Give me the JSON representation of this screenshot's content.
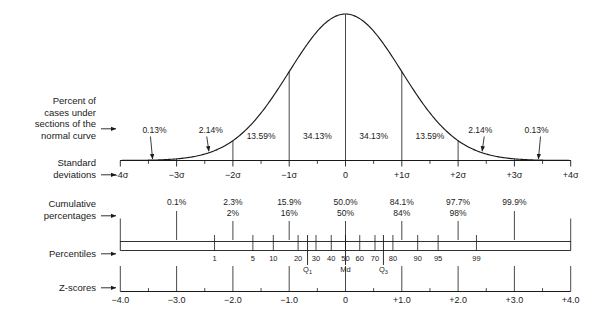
{
  "figure": {
    "background": "#ffffff",
    "ink": "#1a1a1a"
  },
  "row_labels": [
    {
      "id": "percent-of-cases",
      "lines": [
        "Percent of",
        "cases under",
        "sections of the",
        "normal curve"
      ]
    },
    {
      "id": "standard-deviations",
      "lines": [
        "Standard",
        "deviations"
      ]
    },
    {
      "id": "cumulative-percentages",
      "lines": [
        "Cumulative",
        "percentages"
      ]
    },
    {
      "id": "percentiles",
      "lines": [
        "Percentiles"
      ]
    },
    {
      "id": "z-scores",
      "lines": [
        "Z-scores"
      ]
    }
  ],
  "chart_data": {
    "type": "line",
    "xlabel": "Standard deviations",
    "ylabel": "",
    "xlim": [
      -4,
      4
    ],
    "grid": false,
    "legend": null,
    "curve": {
      "name": "normal curve",
      "distribution": "standard normal",
      "mean": 0,
      "sd": 1
    },
    "section_percents": {
      "name": "Percent of cases under sections of the normal curve",
      "bins": [
        {
          "from": -4.0,
          "to": -3.0,
          "label": "0.13%"
        },
        {
          "from": -3.0,
          "to": -2.0,
          "label": "2.14%"
        },
        {
          "from": -2.0,
          "to": -1.0,
          "label": "13.59%"
        },
        {
          "from": -1.0,
          "to": 0.0,
          "label": "34.13%"
        },
        {
          "from": 0.0,
          "to": 1.0,
          "label": "34.13%"
        },
        {
          "from": 1.0,
          "to": 2.0,
          "label": "13.59%"
        },
        {
          "from": 2.0,
          "to": 3.0,
          "label": "2.14%"
        },
        {
          "from": 3.0,
          "to": 4.0,
          "label": "0.13%"
        }
      ],
      "arrow_bins": [
        "0.13%",
        "2.14%"
      ]
    },
    "sd_axis": {
      "name": "Standard deviations",
      "ticks": [
        {
          "value": -4,
          "label": "−4σ"
        },
        {
          "value": -3,
          "label": "−3σ"
        },
        {
          "value": -2,
          "label": "−2σ"
        },
        {
          "value": -1,
          "label": "−1σ"
        },
        {
          "value": 0,
          "label": "0"
        },
        {
          "value": 1,
          "label": "+1σ"
        },
        {
          "value": 2,
          "label": "+2σ"
        },
        {
          "value": 3,
          "label": "+3σ"
        },
        {
          "value": 4,
          "label": "+4σ"
        }
      ],
      "minor_ticks": [
        -3.5,
        -2.5,
        -1.5,
        -0.5,
        0.5,
        1.5,
        2.5,
        3.5
      ]
    },
    "cumulative_percentages": {
      "name": "Cumulative percentages",
      "points": [
        {
          "z": -3,
          "exact": "0.1%",
          "rounded": ""
        },
        {
          "z": -2,
          "exact": "2.3%",
          "rounded": "2%"
        },
        {
          "z": -1,
          "exact": "15.9%",
          "rounded": "16%"
        },
        {
          "z": 0,
          "exact": "50.0%",
          "rounded": "50%"
        },
        {
          "z": 1,
          "exact": "84.1%",
          "rounded": "84%"
        },
        {
          "z": 2,
          "exact": "97.7%",
          "rounded": "98%"
        },
        {
          "z": 3,
          "exact": "99.9%",
          "rounded": ""
        }
      ]
    },
    "percentiles": {
      "name": "Percentiles",
      "values": [
        1,
        5,
        10,
        20,
        30,
        40,
        50,
        60,
        70,
        80,
        90,
        95,
        99
      ],
      "z_positions": [
        -2.326,
        -1.645,
        -1.282,
        -0.842,
        -0.524,
        -0.253,
        0,
        0.253,
        0.524,
        0.842,
        1.282,
        1.645,
        2.326
      ],
      "markers": [
        {
          "label": "Q",
          "subscript": "1",
          "percentile": 25,
          "z": -0.674
        },
        {
          "label": "Md",
          "subscript": "",
          "percentile": 50,
          "z": 0
        },
        {
          "label": "Q",
          "subscript": "3",
          "percentile": 75,
          "z": 0.674
        }
      ]
    },
    "z_scores": {
      "name": "Z-scores",
      "ticks": [
        {
          "value": -4,
          "label": "−4.0"
        },
        {
          "value": -3,
          "label": "−3.0"
        },
        {
          "value": -2,
          "label": "−2.0"
        },
        {
          "value": -1,
          "label": "−1.0"
        },
        {
          "value": 0,
          "label": "0"
        },
        {
          "value": 1,
          "label": "+1.0"
        },
        {
          "value": 2,
          "label": "+2.0"
        },
        {
          "value": 3,
          "label": "+3.0"
        },
        {
          "value": 4,
          "label": "+4.0"
        }
      ],
      "minor_ticks": [
        -3.5,
        -2.5,
        -1.5,
        -0.5,
        0.5,
        1.5,
        2.5,
        3.5
      ]
    }
  }
}
